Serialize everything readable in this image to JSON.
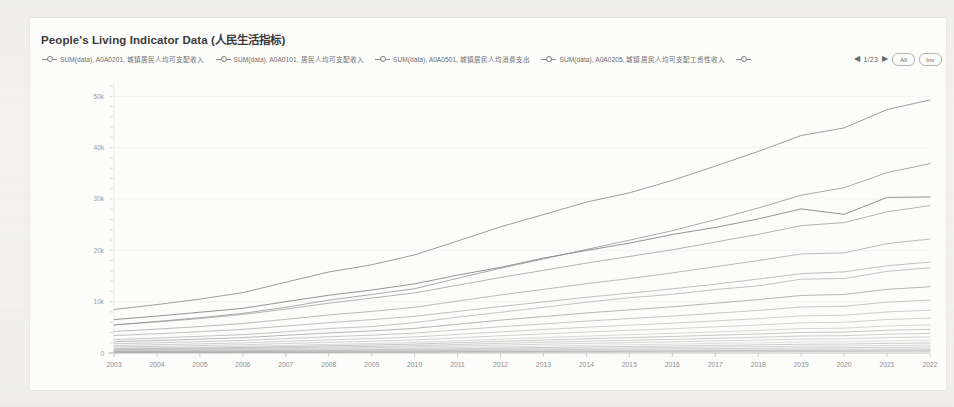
{
  "page": {
    "background_color": "#f3f2f0",
    "card_background": "#fcfcfb"
  },
  "chart_card": {
    "title": "People's Living Indicator Data (人民生活指标)",
    "legend": {
      "marker_icon": "line-circle-marker",
      "items": [
        {
          "label": "SUM(data), A0A0201, 城镇居民人均可支配收入"
        },
        {
          "label": "SUM(data), A0A0101, 居民人均可支配收入"
        },
        {
          "label": "SUM(data), A0A0501, 城镇居民人均消费支出"
        },
        {
          "label": "SUM(data), A0A0205, 城镇居民人均可支配工资性收入"
        }
      ],
      "pager": {
        "prev_icon": "◀",
        "next_icon": "▶",
        "count": "1/23",
        "all_label": "All",
        "inv_label": "Inv"
      }
    }
  },
  "chart_data": {
    "type": "line",
    "title": "People's Living Indicator Data (人民生活指标)",
    "xlabel": "",
    "ylabel": "",
    "grid": false,
    "legend_position": "top",
    "xlim": [
      2003,
      2022
    ],
    "ylim": [
      0,
      52000
    ],
    "x": [
      2003,
      2004,
      2005,
      2006,
      2007,
      2008,
      2009,
      2010,
      2011,
      2012,
      2013,
      2014,
      2015,
      2016,
      2017,
      2018,
      2019,
      2020,
      2021,
      2022
    ],
    "ytick_labels": [
      "0",
      "10k",
      "20k",
      "30k",
      "40k",
      "50k"
    ],
    "ytick_values": [
      0,
      10000,
      20000,
      30000,
      40000,
      50000
    ],
    "xtick_labels": [
      "2003",
      "2004",
      "2005",
      "2006",
      "2007",
      "2008",
      "2009",
      "2010",
      "2011",
      "2012",
      "2013",
      "2014",
      "2015",
      "2016",
      "2017",
      "2018",
      "2019",
      "2020",
      "2021",
      "2022"
    ],
    "series": [
      {
        "name": "SUM(data), A0A0201, 城镇居民人均可支配收入",
        "color": "#7b7b7b",
        "values": [
          8472,
          9422,
          10493,
          11760,
          13786,
          15781,
          17175,
          19109,
          21810,
          24565,
          26955,
          29381,
          31195,
          33616,
          36396,
          39251,
          42359,
          43834,
          47412,
          49283
        ]
      },
      {
        "name": "SUM(data), A0A0101, 居民人均可支配收入",
        "color": "#8d8d8d",
        "values": [
          5450,
          6150,
          6880,
          7730,
          8900,
          10300,
          11400,
          12520,
          14550,
          16510,
          18311,
          20167,
          21966,
          23821,
          25974,
          28228,
          30733,
          32189,
          35128,
          36883
        ]
      },
      {
        "name": "SUM(data), A0A0501, 城镇居民人均消费支出",
        "color": "#6f6f6f",
        "values": [
          6511,
          7182,
          7943,
          8697,
          9997,
          11243,
          12265,
          13471,
          15161,
          16674,
          18488,
          19968,
          21392,
          23079,
          24445,
          26112,
          28063,
          27007,
          30307,
          30391
        ]
      },
      {
        "name": "SUM(data), A0A0205, 城镇居民人均可支配工资性收入",
        "color": "#9a9a9a",
        "values": [
          5470,
          6050,
          6700,
          7500,
          8550,
          9700,
          10700,
          11700,
          13200,
          14700,
          16100,
          17500,
          18800,
          20100,
          21600,
          23100,
          24800,
          25400,
          27500,
          28700
        ]
      },
      {
        "name": "series-5",
        "color": "#a3a3a3",
        "values": [
          4200,
          4650,
          5150,
          5750,
          6550,
          7400,
          8100,
          8900,
          10100,
          11300,
          12400,
          13500,
          14500,
          15600,
          16800,
          18000,
          19300,
          19500,
          21300,
          22200
        ]
      },
      {
        "name": "series-6",
        "color": "#aaaaaa",
        "values": [
          3400,
          3750,
          4150,
          4600,
          5250,
          5900,
          6500,
          7150,
          8100,
          9050,
          9950,
          10850,
          11650,
          12500,
          13400,
          14400,
          15450,
          15800,
          17000,
          17700
        ]
      },
      {
        "name": "series-7",
        "color": "#b0b0b0",
        "values": [
          2620,
          2900,
          3255,
          3587,
          4140,
          4761,
          5153,
          5919,
          6977,
          7917,
          8896,
          9892,
          10772,
          11422,
          12363,
          13066,
          14389,
          14500,
          15900,
          16600
        ]
      },
      {
        "name": "series-8",
        "color": "#9e9e9e",
        "values": [
          2200,
          2430,
          2700,
          3000,
          3450,
          3900,
          4300,
          4800,
          5600,
          6400,
          7100,
          7800,
          8400,
          9000,
          9700,
          10400,
          11200,
          11400,
          12400,
          12900
        ]
      },
      {
        "name": "series-9",
        "color": "#b5b5b5",
        "values": [
          1800,
          1980,
          2200,
          2440,
          2800,
          3160,
          3480,
          3870,
          4500,
          5100,
          5660,
          6220,
          6700,
          7190,
          7740,
          8300,
          8950,
          9100,
          9900,
          10300
        ]
      },
      {
        "name": "series-10",
        "color": "#8f8f8f",
        "values": [
          1450,
          1600,
          1780,
          1970,
          2260,
          2550,
          2810,
          3120,
          3630,
          4110,
          4570,
          5020,
          5410,
          5810,
          6250,
          6700,
          7230,
          7350,
          8000,
          8330
        ]
      },
      {
        "name": "series-11",
        "color": "#999999",
        "values": [
          1180,
          1300,
          1445,
          1600,
          1840,
          2080,
          2290,
          2540,
          2950,
          3350,
          3720,
          4090,
          4410,
          4730,
          5090,
          5460,
          5890,
          5990,
          6520,
          6790
        ]
      },
      {
        "name": "series-12",
        "color": "#a8a8a8",
        "values": [
          950,
          1050,
          1165,
          1290,
          1485,
          1675,
          1845,
          2050,
          2385,
          2700,
          3000,
          3300,
          3560,
          3820,
          4110,
          4400,
          4750,
          4830,
          5260,
          5480
        ]
      },
      {
        "name": "series-13",
        "color": "#7f7f7f",
        "values": [
          800,
          885,
          980,
          1085,
          1250,
          1410,
          1555,
          1725,
          2005,
          2270,
          2525,
          2775,
          2995,
          3215,
          3460,
          3705,
          4000,
          4070,
          4430,
          4615
        ]
      },
      {
        "name": "series-14",
        "color": "#909090",
        "values": [
          660,
          730,
          810,
          897,
          1033,
          1165,
          1285,
          1425,
          1657,
          1877,
          2086,
          2293,
          2475,
          2656,
          2858,
          3060,
          3305,
          3362,
          3660,
          3812
        ]
      },
      {
        "name": "series-15",
        "color": "#a0a0a0",
        "values": [
          540,
          598,
          663,
          734,
          845,
          953,
          1051,
          1166,
          1356,
          1536,
          1707,
          1877,
          2026,
          2174,
          2339,
          2504,
          2704,
          2751,
          2995,
          3120
        ]
      },
      {
        "name": "series-16",
        "color": "#b8b8b8",
        "values": [
          430,
          476,
          528,
          584,
          673,
          759,
          837,
          928,
          1080,
          1223,
          1359,
          1494,
          1613,
          1731,
          1863,
          1994,
          2153,
          2191,
          2385,
          2484
        ]
      },
      {
        "name": "series-17",
        "color": "#8b8b8b",
        "values": [
          340,
          376,
          417,
          462,
          532,
          600,
          662,
          734,
          854,
          967,
          1074,
          1181,
          1275,
          1369,
          1473,
          1577,
          1703,
          1733,
          1886,
          1965
        ]
      },
      {
        "name": "series-18",
        "color": "#a5a5a5",
        "values": [
          265,
          293,
          325,
          360,
          415,
          468,
          516,
          572,
          666,
          754,
          838,
          921,
          994,
          1067,
          1149,
          1229,
          1327,
          1351,
          1470,
          1531
        ]
      },
      {
        "name": "series-19",
        "color": "#959595",
        "values": [
          200,
          221,
          246,
          272,
          313,
          353,
          389,
          432,
          503,
          569,
          632,
          695,
          750,
          805,
          867,
          928,
          1002,
          1020,
          1110,
          1156
        ]
      },
      {
        "name": "series-20",
        "color": "#bdbdbd",
        "values": [
          150,
          166,
          184,
          204,
          235,
          265,
          292,
          324,
          377,
          427,
          474,
          521,
          563,
          604,
          650,
          696,
          751,
          765,
          832,
          867
        ]
      },
      {
        "name": "series-21",
        "color": "#868686",
        "values": [
          110,
          122,
          135,
          150,
          172,
          194,
          214,
          238,
          277,
          313,
          348,
          382,
          413,
          443,
          477,
          510,
          551,
          561,
          610,
          636
        ]
      },
      {
        "name": "series-22",
        "color": "#acacac",
        "values": [
          80,
          88,
          98,
          109,
          125,
          141,
          156,
          173,
          201,
          228,
          253,
          278,
          300,
          322,
          347,
          371,
          401,
          408,
          444,
          462
        ]
      },
      {
        "name": "series-23",
        "color": "#9c9c9c",
        "values": [
          55,
          61,
          68,
          75,
          86,
          97,
          107,
          119,
          139,
          157,
          174,
          191,
          207,
          222,
          239,
          256,
          276,
          281,
          306,
          319
        ]
      }
    ]
  }
}
